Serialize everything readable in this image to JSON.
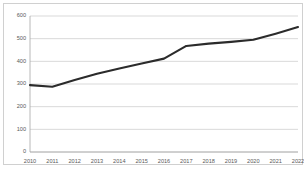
{
  "chart_data": {
    "type": "line",
    "title": "",
    "subtitle": "",
    "xlabel": "",
    "ylabel": "",
    "categories": [
      "2010",
      "2011",
      "2012",
      "2013",
      "2014",
      "2015",
      "2016",
      "2017",
      "2018",
      "2019",
      "2020",
      "2021",
      "2022"
    ],
    "values": [
      295,
      288,
      318,
      345,
      368,
      390,
      412,
      468,
      478,
      486,
      495,
      522,
      551
    ],
    "series": [
      {
        "name": "",
        "values": [
          295,
          288,
          318,
          345,
          368,
          390,
          412,
          468,
          478,
          486,
          495,
          522,
          551
        ]
      }
    ],
    "ylim": [
      0,
      600
    ],
    "yticks": [
      0,
      100,
      200,
      300,
      400,
      500,
      600
    ],
    "ytick_labels": [
      "0",
      "100",
      "200",
      "300",
      "400",
      "500",
      "600"
    ],
    "xtick_labels": [
      "2010",
      "2011",
      "2012",
      "2013",
      "2014",
      "2015",
      "2016",
      "2017",
      "2018",
      "2019",
      "2020",
      "2021",
      "2022"
    ],
    "grid": true,
    "grid_axis": "y",
    "legend": false,
    "legend_position": "none",
    "line_color": "#2b2b2b",
    "grid_color": "#c8c8c8",
    "axis_color": "#a6a6a6",
    "tick_label_color": "#595959",
    "background_color": "#ffffff",
    "border_color": "#d0d0d0"
  }
}
